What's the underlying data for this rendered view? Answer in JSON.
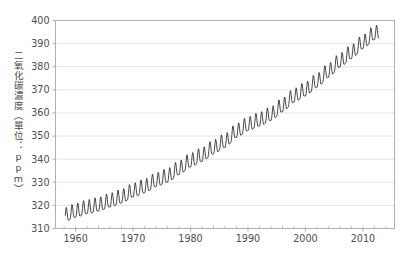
{
  "chart_data": {
    "type": "line",
    "title": "",
    "subtitle": "",
    "xlabel": "",
    "ylabel": "二氧化碳濃度（單位：ppm）",
    "ylabel_parts": [
      "二",
      "氧",
      "化",
      "碳",
      "濃",
      "度",
      "（",
      "單",
      "位",
      "：",
      "p",
      "p",
      "m",
      "）"
    ],
    "xlim": [
      1956.5,
      2015.5
    ],
    "ylim": [
      310,
      400
    ],
    "xticks": [
      1960,
      1970,
      1980,
      1990,
      2000,
      2010
    ],
    "xtick_labels": [
      "1960",
      "1970",
      "1980",
      "1990",
      "2000",
      "2010"
    ],
    "minor_xtick_interval": 2,
    "yticks": [
      310,
      320,
      330,
      340,
      350,
      360,
      370,
      380,
      390,
      400
    ],
    "ytick_labels": [
      "310",
      "320",
      "330",
      "340",
      "350",
      "360",
      "370",
      "380",
      "390",
      "400"
    ],
    "grid": "horizontal",
    "grid_color": "#e0e0e0",
    "line_color": "#1a1a1a",
    "line_width": 0.8,
    "frame_color": "#b0b0b0",
    "background_color": "#ffffff",
    "legend": "none",
    "series": [
      {
        "name": "Atmospheric CO2 (Mauna Loa monthly mean)",
        "seasonal_amplitude_ppm": 6.0,
        "x_start": 1958.2,
        "x_end": 2012.8,
        "annual_trend": {
          "x": [
            1958,
            1960,
            1962,
            1964,
            1966,
            1968,
            1970,
            1972,
            1974,
            1976,
            1978,
            1980,
            1982,
            1984,
            1986,
            1988,
            1990,
            1992,
            1994,
            1996,
            1998,
            2000,
            2002,
            2004,
            2006,
            2008,
            2010,
            2012,
            2013
          ],
          "values": [
            315.0,
            316.9,
            318.5,
            319.6,
            321.4,
            323.1,
            325.7,
            327.5,
            330.2,
            332.1,
            335.4,
            338.7,
            341.1,
            344.4,
            347.2,
            351.5,
            354.4,
            356.4,
            358.8,
            362.6,
            366.7,
            369.5,
            373.2,
            377.5,
            381.9,
            385.6,
            389.9,
            393.8,
            394.5
          ]
        }
      }
    ]
  },
  "ylabel_vertical": "二氧化碳濃度（單位：ppm）"
}
